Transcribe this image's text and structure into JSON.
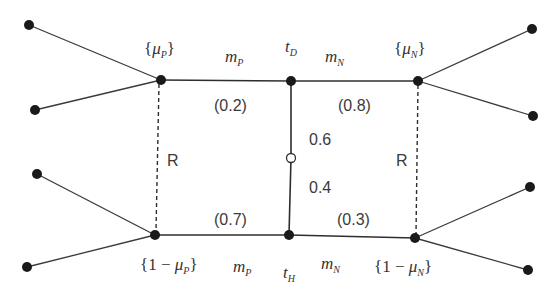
{
  "diagram": {
    "type": "game-tree / signaling network",
    "colors": {
      "line": "#2e2e2e",
      "node": "#1a1a1a",
      "open_node": "#ffffff",
      "text": "#333333"
    },
    "nodes": {
      "top_left": {
        "x": 161,
        "y": 80,
        "label_open": "{",
        "label_sym": "μ",
        "label_sub": "P",
        "label_close": "}"
      },
      "top_mid": {
        "x": 291,
        "y": 81,
        "label_sym": "t",
        "label_sub": "D"
      },
      "top_right": {
        "x": 418,
        "y": 81,
        "label_open": "{",
        "label_sym": "μ",
        "label_sub": "N",
        "label_close": "}"
      },
      "bottom_left": {
        "x": 155,
        "y": 235,
        "label_open": "{1 − ",
        "label_sym": "μ",
        "label_sub": "P",
        "label_close": "}"
      },
      "bottom_mid": {
        "x": 289,
        "y": 235,
        "label_sym": "t",
        "label_sub": "H"
      },
      "bottom_right": {
        "x": 415,
        "y": 238,
        "label_open": "{1 − ",
        "label_sym": "μ",
        "label_sub": "N",
        "label_close": "}"
      },
      "chance": {
        "x": 291,
        "y": 158
      }
    },
    "edge_labels": {
      "top_left_message": {
        "sym": "m",
        "sub": "P"
      },
      "top_right_message": {
        "sym": "m",
        "sub": "N"
      },
      "bottom_left_message": {
        "sym": "m",
        "sub": "P"
      },
      "bottom_right_message": {
        "sym": "m",
        "sub": "N"
      }
    },
    "probabilities": {
      "top_left": "(0.2)",
      "top_right": "(0.8)",
      "bottom_left": "(0.7)",
      "bottom_right": "(0.3)",
      "nature_up": "0.6",
      "nature_down": "0.4"
    },
    "info_sets": {
      "left": "R",
      "right": "R"
    },
    "terminal_nodes": [
      {
        "x": 29,
        "y": 25
      },
      {
        "x": 35,
        "y": 110
      },
      {
        "x": 37,
        "y": 174
      },
      {
        "x": 27,
        "y": 267
      },
      {
        "x": 532,
        "y": 29
      },
      {
        "x": 533,
        "y": 116
      },
      {
        "x": 530,
        "y": 187
      },
      {
        "x": 528,
        "y": 270
      }
    ]
  }
}
